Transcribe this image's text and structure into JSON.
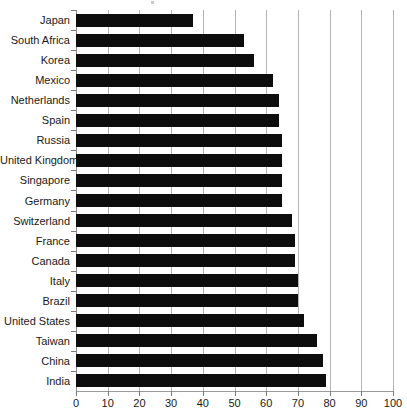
{
  "chart_data": {
    "type": "bar",
    "orientation": "horizontal",
    "title": "",
    "subtitle": "",
    "xlabel": "",
    "ylabel": "",
    "xlim": [
      0,
      100
    ],
    "ylim": null,
    "grid": true,
    "legend": false,
    "legend_position": "none",
    "xticks": [
      0,
      10,
      20,
      30,
      40,
      50,
      60,
      70,
      80,
      90,
      100
    ],
    "xtick_labels": [
      "0",
      "10",
      "20",
      "30",
      "40",
      "50",
      "60",
      "70",
      "80",
      "90",
      "100"
    ],
    "bar_color": "#0d0d0d",
    "grid_color": "#b4b4b4",
    "background_color": "#ffffff",
    "categories": [
      "Japan",
      "South Africa",
      "Korea",
      "Mexico",
      "Netherlands",
      "Spain",
      "Russia",
      "United Kingdom",
      "Singapore",
      "Germany",
      "Switzerland",
      "France",
      "Canada",
      "Italy",
      "Brazil",
      "United States",
      "Taiwan",
      "China",
      "India"
    ],
    "values": [
      37,
      53,
      56,
      62,
      64,
      64,
      65,
      65,
      65,
      65,
      68,
      69,
      69,
      70,
      70,
      72,
      76,
      78,
      79
    ],
    "series": [
      {
        "name": "value",
        "values": [
          37,
          53,
          56,
          62,
          64,
          64,
          65,
          65,
          65,
          65,
          68,
          69,
          69,
          70,
          70,
          72,
          76,
          78,
          79
        ]
      }
    ]
  }
}
